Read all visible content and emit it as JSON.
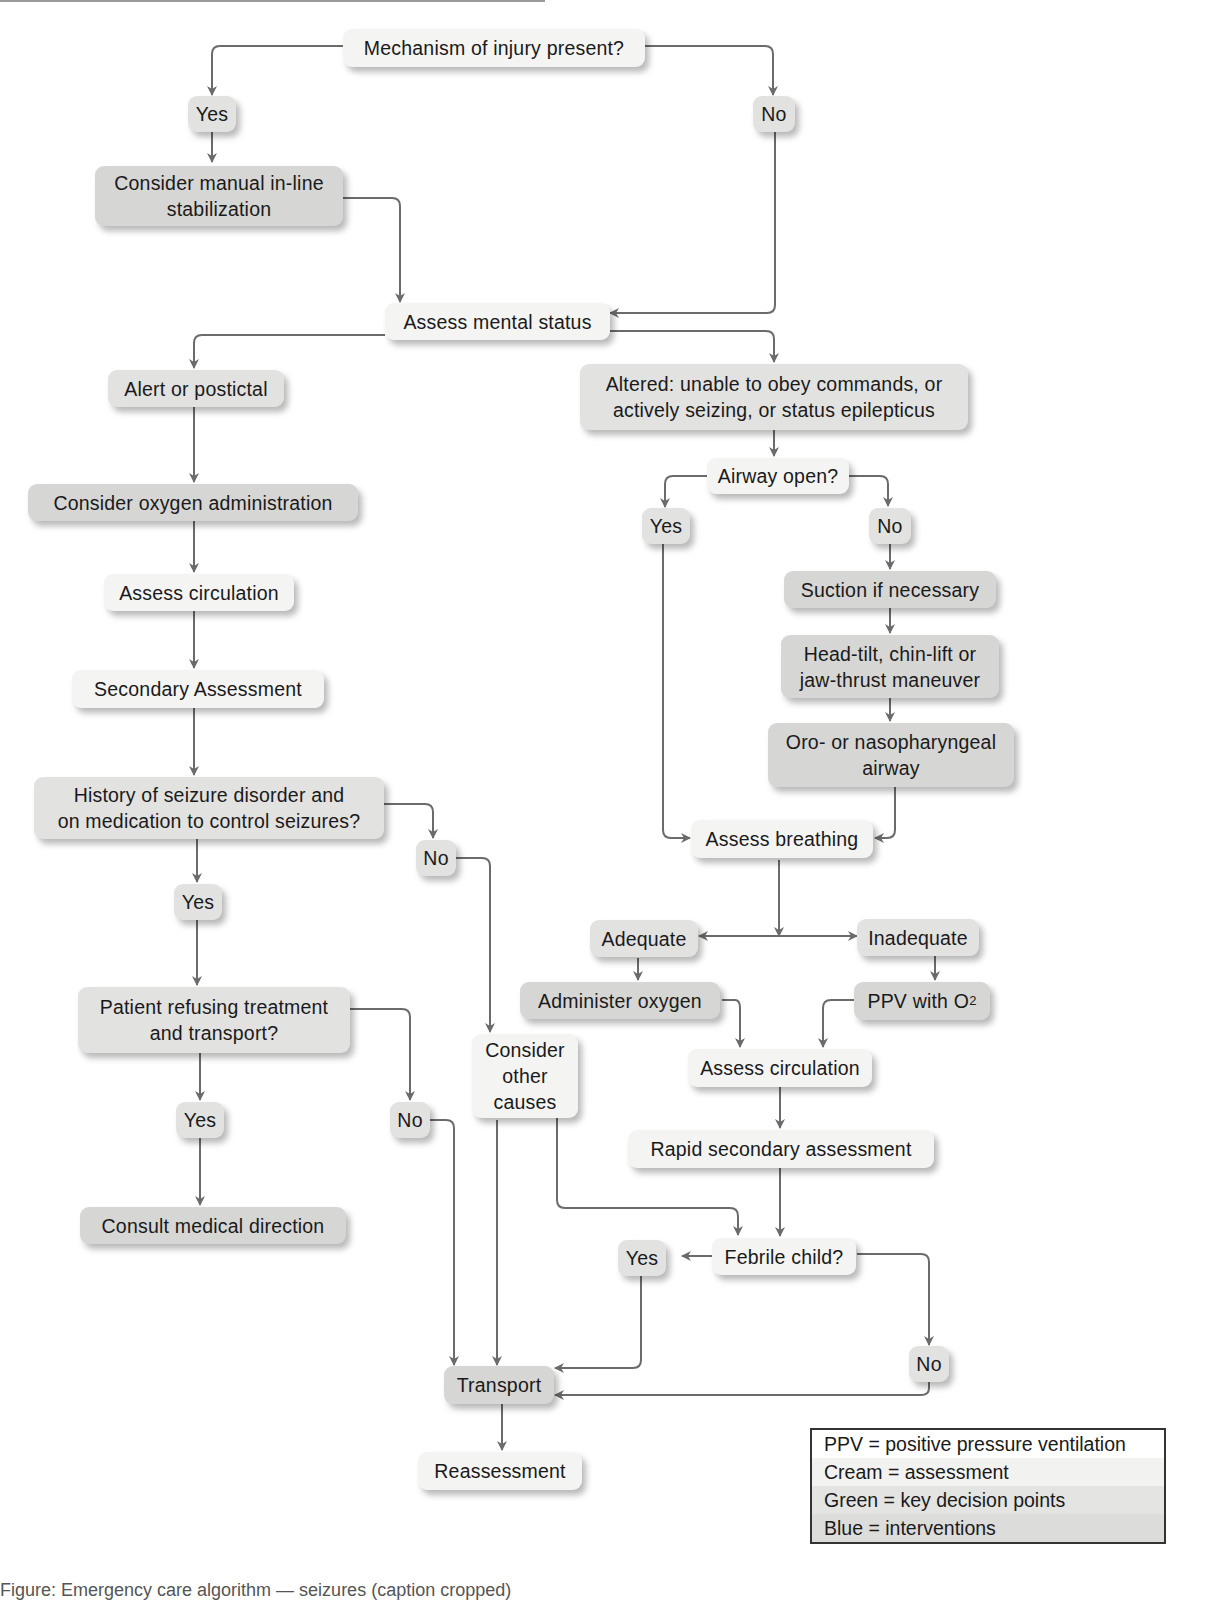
{
  "nodes": {
    "mechanism": "Mechanism of injury present?",
    "yes_mech": "Yes",
    "no_mech": "No",
    "manual_stab": "Consider manual in-line\nstabilization",
    "mental_status": "Assess mental status",
    "alert": "Alert or postictal",
    "altered": "Altered: unable to obey commands, or\nactively seizing, or status epilepticus",
    "oxygen_admin": "Consider oxygen administration",
    "assess_circ_left": "Assess circulation",
    "secondary": "Secondary Assessment",
    "history": "History of seizure disorder and\non medication to control seizures?",
    "yes_hist": "Yes",
    "no_hist": "No",
    "refusing": "Patient refusing treatment\nand transport?",
    "yes_ref": "Yes",
    "no_ref": "No",
    "consult": "Consult medical direction",
    "other_causes": "Consider\nother\ncauses",
    "airway_open": "Airway open?",
    "yes_airway": "Yes",
    "no_airway": "No",
    "suction": "Suction if necessary",
    "head_tilt": "Head-tilt, chin-lift or\njaw-thrust maneuver",
    "oro": "Oro- or nasopharyngeal\nairway",
    "assess_breathing": "Assess breathing",
    "adequate": "Adequate",
    "inadequate": "Inadequate",
    "admin_oxygen": "Administer oxygen",
    "ppv_prefix": "PPV with O",
    "ppv_sub": "2",
    "assess_circ_right": "Assess circulation",
    "rapid_secondary": "Rapid secondary assessment",
    "febrile": "Febrile child?",
    "yes_febrile": "Yes",
    "no_febrile": "No",
    "transport": "Transport",
    "reassessment": "Reassessment"
  },
  "legend": {
    "rows": [
      "PPV = positive pressure ventilation",
      "Cream = assessment",
      "Green = key decision points",
      "Blue = interventions"
    ],
    "colors": [
      "#ffffff",
      "#f2f2f1",
      "#e4e4e3",
      "#dcdcdb"
    ]
  },
  "colors": {
    "cream": "#f4f4f3",
    "green": "#e2e2e1",
    "blue": "#d6d6d5",
    "connector": "#6b6b6b"
  },
  "caption": "Figure: Emergency care algorithm — seizures (caption cropped)"
}
